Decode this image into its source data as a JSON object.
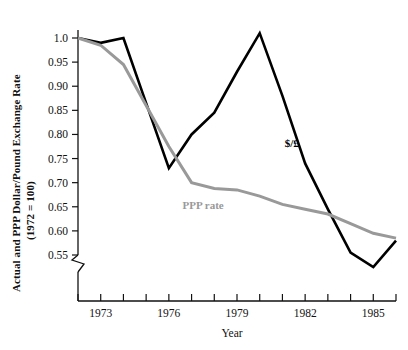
{
  "chart_data": {
    "type": "line",
    "title": "",
    "xlabel": "Year",
    "ylabel": "Actual and PPP Dollar/Pound Exchange Rate",
    "ylabel_sub": "(1972 = 100)",
    "xlim": [
      1972,
      1986
    ],
    "ylim": [
      0.5,
      1.02
    ],
    "grid": false,
    "axis_break": true,
    "legend_position": "inline-annotations",
    "yticks": [
      0.55,
      0.6,
      0.65,
      0.7,
      0.75,
      0.8,
      0.85,
      0.9,
      0.95,
      1.0
    ],
    "ytick_labels": [
      "0.55",
      "0.60",
      "0.65",
      "0.70",
      "0.75",
      "0.80",
      "0.85",
      "0.90",
      "0.95",
      "1.0"
    ],
    "xticks": [
      1972,
      1973,
      1974,
      1975,
      1976,
      1977,
      1978,
      1979,
      1980,
      1981,
      1982,
      1983,
      1984,
      1985,
      1986
    ],
    "xtick_labels": [
      "",
      "1973",
      "",
      "",
      "1976",
      "",
      "",
      "1979",
      "",
      "",
      "1982",
      "",
      "",
      "1985",
      ""
    ],
    "x": [
      1972,
      1973,
      1974,
      1975,
      1976,
      1977,
      1978,
      1979,
      1980,
      1981,
      1982,
      1983,
      1984,
      1985,
      1986
    ],
    "series": [
      {
        "name": "$/£",
        "color": "#000000",
        "label_x": 1981.1,
        "label_y": 0.775,
        "values": [
          1.0,
          0.99,
          1.0,
          0.865,
          0.73,
          0.8,
          0.845,
          0.93,
          1.01,
          0.88,
          0.74,
          0.645,
          0.555,
          0.525,
          0.58
        ]
      },
      {
        "name": "PPP rate",
        "color": "#999999",
        "label_x": 1976.6,
        "label_y": 0.645,
        "values": [
          1.0,
          0.985,
          0.945,
          0.86,
          0.775,
          0.7,
          0.688,
          0.685,
          0.672,
          0.655,
          0.645,
          0.635,
          0.615,
          0.595,
          0.585
        ]
      }
    ]
  }
}
